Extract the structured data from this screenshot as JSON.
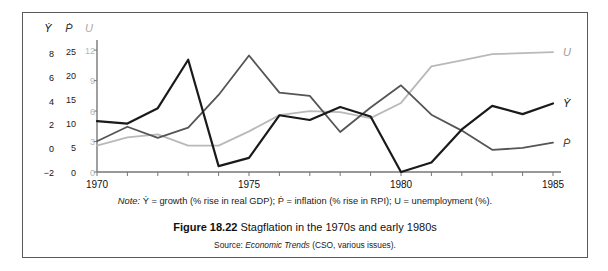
{
  "figure": {
    "caption_prefix": "Figure 18.22",
    "caption_text": "Stagflation in the 1970s and early 1980s",
    "note_prefix": "Note:",
    "note_text": " Ẏ = growth (% rise in real GDP); Ṗ = inflation (% rise in RPI); U = unemployment (%).",
    "source_prefix": "Source:",
    "source_italic": "Economic Trends",
    "source_rest": " (CSO, various issues)."
  },
  "colors": {
    "growth": "#1a1a1a",
    "inflation": "#555555",
    "unemployment": "#b9b9b9",
    "axis": "#777777",
    "frame": "#5a5a5a"
  },
  "axes": {
    "growth_header": "Ẏ",
    "inflation_header": "Ṗ",
    "unemployment_header": "U",
    "growth_ticks": [
      "8",
      "6",
      "4",
      "2",
      "0",
      "−2"
    ],
    "inflation_ticks": [
      "25",
      "20",
      "15",
      "10",
      "5",
      "0"
    ],
    "unemployment_ticks": [
      "12",
      "9",
      "6",
      "3",
      "0"
    ],
    "x_ticks": [
      "1970",
      "1975",
      "1980",
      "1985"
    ]
  },
  "end_labels": {
    "unemployment": "U",
    "growth": "Ẏ",
    "inflation": "Ṗ"
  },
  "chart_data": {
    "type": "line",
    "title": "Stagflation in the 1970s and early 1980s",
    "xlabel": "",
    "ylabel": "",
    "grid": false,
    "legend": "line-end labels at right",
    "x": [
      1970,
      1971,
      1972,
      1973,
      1974,
      1975,
      1976,
      1977,
      1978,
      1979,
      1980,
      1981,
      1982,
      1983,
      1984,
      1985
    ],
    "x_tick_labels": [
      "1970",
      "1975",
      "1980",
      "1985"
    ],
    "xlim": [
      1970,
      1985
    ],
    "series": [
      {
        "name": "Ẏ",
        "description": "growth (% rise in real GDP)",
        "color": "#1a1a1a",
        "axis": "left-1",
        "ylim": [
          -2,
          9
        ],
        "ytick_values": [
          8,
          6,
          4,
          2,
          0,
          -2
        ],
        "values": [
          2.3,
          2.1,
          3.4,
          7.5,
          -1.5,
          -0.8,
          2.8,
          2.4,
          3.5,
          2.7,
          -2.0,
          -1.2,
          1.6,
          3.6,
          2.9,
          3.8
        ]
      },
      {
        "name": "Ṗ",
        "description": "inflation (% rise in RPI)",
        "color": "#555555",
        "axis": "left-2",
        "ylim": [
          0,
          27
        ],
        "ytick_values": [
          25,
          20,
          15,
          10,
          5,
          0
        ],
        "values": [
          6.4,
          9.4,
          7.1,
          9.2,
          16.0,
          24.2,
          16.5,
          15.8,
          8.3,
          13.4,
          18.0,
          11.9,
          8.6,
          4.6,
          5.0,
          6.1
        ]
      },
      {
        "name": "U",
        "description": "unemployment (%)",
        "color": "#b9b9b9",
        "axis": "left-3",
        "ylim": [
          0,
          12.8
        ],
        "ytick_values": [
          12,
          9,
          6,
          3,
          0
        ],
        "values": [
          2.6,
          3.4,
          3.7,
          2.6,
          2.6,
          4.0,
          5.6,
          6.0,
          5.9,
          5.3,
          6.8,
          10.4,
          11.0,
          11.6,
          11.7,
          11.8
        ]
      }
    ]
  }
}
